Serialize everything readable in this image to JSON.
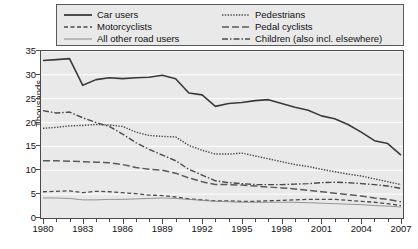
{
  "chart_data": {
    "type": "line",
    "title": "",
    "xlabel": "",
    "ylabel": "Thousands",
    "xlim": [
      1980,
      2007
    ],
    "ylim": [
      0,
      35
    ],
    "ytick_values": [
      0,
      5,
      10,
      15,
      20,
      25,
      30,
      35
    ],
    "xtick_labels": [
      "1980",
      "1983",
      "1986",
      "1989",
      "1992",
      "1995",
      "1998",
      "2001",
      "2004",
      "2007"
    ],
    "xtick_values": [
      1980,
      1983,
      1986,
      1989,
      1992,
      1995,
      1998,
      2001,
      2004,
      2007
    ],
    "x": [
      1980,
      1981,
      1982,
      1983,
      1984,
      1985,
      1986,
      1987,
      1988,
      1989,
      1990,
      1991,
      1992,
      1993,
      1994,
      1995,
      1996,
      1997,
      1998,
      1999,
      2000,
      2001,
      2002,
      2003,
      2004,
      2005,
      2006,
      2007
    ],
    "grid": "horizontal",
    "legend_position": "top",
    "series": [
      {
        "name": "Car users",
        "style": "solid",
        "width": 1.6,
        "color": "#3a3a3a",
        "values": [
          33.0,
          33.2,
          33.4,
          27.8,
          29.0,
          29.4,
          29.2,
          29.4,
          29.5,
          29.9,
          29.2,
          26.2,
          25.8,
          23.4,
          24.0,
          24.2,
          24.6,
          24.8,
          24.0,
          23.2,
          22.6,
          21.4,
          20.8,
          19.6,
          18.0,
          16.2,
          15.6,
          13.2
        ]
      },
      {
        "name": "Motorcyclists",
        "style": "dashed",
        "width": 1.3,
        "color": "#4a4a4a",
        "values": [
          5.5,
          5.6,
          5.7,
          5.3,
          5.6,
          5.5,
          5.3,
          5.1,
          4.8,
          4.7,
          4.4,
          4.0,
          3.8,
          3.6,
          3.6,
          3.5,
          3.5,
          3.6,
          3.7,
          3.8,
          3.9,
          3.9,
          3.9,
          3.7,
          3.5,
          3.3,
          3.0,
          2.6
        ]
      },
      {
        "name": "All other road users",
        "style": "solid",
        "width": 0.9,
        "color": "#8a8a8a",
        "values": [
          4.2,
          4.2,
          4.1,
          3.8,
          3.8,
          3.9,
          3.9,
          4.0,
          4.1,
          4.2,
          4.1,
          3.9,
          3.7,
          3.5,
          3.4,
          3.3,
          3.3,
          3.3,
          3.3,
          3.3,
          3.2,
          3.1,
          3.0,
          2.9,
          2.8,
          2.6,
          2.5,
          2.3
        ]
      },
      {
        "name": "Pedestrians",
        "style": "dotted",
        "width": 1.4,
        "color": "#4a4a4a",
        "values": [
          18.8,
          19.0,
          19.3,
          19.4,
          19.6,
          19.5,
          19.2,
          18.0,
          17.3,
          17.1,
          17.0,
          15.2,
          14.2,
          13.4,
          13.4,
          13.6,
          13.0,
          12.4,
          11.8,
          11.2,
          10.8,
          10.2,
          9.7,
          9.2,
          8.8,
          8.2,
          7.6,
          7.0
        ]
      },
      {
        "name": "Pedal cyclists",
        "style": "longdash",
        "width": 1.5,
        "color": "#5a5a5a",
        "values": [
          12.0,
          12.0,
          11.9,
          11.8,
          11.7,
          11.6,
          11.2,
          10.6,
          10.2,
          10.0,
          9.4,
          8.4,
          7.6,
          7.0,
          7.0,
          6.9,
          6.7,
          6.5,
          6.3,
          6.1,
          5.8,
          5.5,
          5.2,
          4.9,
          4.6,
          4.2,
          3.9,
          3.4
        ]
      },
      {
        "name": "Children (also incl. elsewhere)",
        "style": "dashdot",
        "width": 1.4,
        "color": "#4a4a4a",
        "values": [
          22.5,
          22.0,
          22.2,
          21.0,
          20.0,
          19.2,
          17.6,
          15.8,
          14.4,
          13.2,
          12.0,
          10.2,
          9.0,
          7.8,
          7.4,
          7.2,
          7.0,
          7.0,
          7.0,
          7.1,
          7.2,
          7.4,
          7.5,
          7.4,
          7.2,
          7.0,
          6.7,
          6.2
        ]
      }
    ]
  },
  "legend": {
    "entries": [
      {
        "label": "Car users",
        "style": "solid-thick"
      },
      {
        "label": "Motorcyclists",
        "style": "dashed"
      },
      {
        "label": "All other road users",
        "style": "solid-thin"
      },
      {
        "label": "Pedestrians",
        "style": "dotted"
      },
      {
        "label": "Pedal cyclists",
        "style": "longdash"
      },
      {
        "label": "Children (also incl. elsewhere)",
        "style": "dashdot"
      }
    ]
  }
}
